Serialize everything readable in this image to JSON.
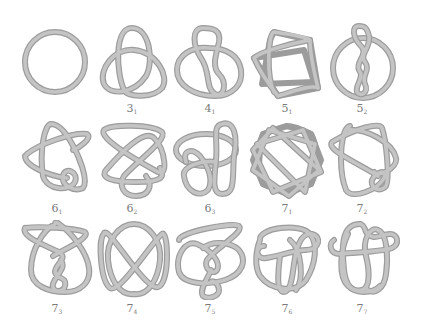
{
  "figure": {
    "stroke_colors": {
      "outline": "#9c9c9c",
      "fill": "#c4c4c4",
      "label": "#7a7a7a"
    },
    "rows": [
      {
        "knots": [
          {
            "id": "unknot",
            "crossings": "",
            "index": "",
            "label_visible": false
          },
          {
            "id": "3_1",
            "crossings": "3",
            "index": "1",
            "label_visible": true
          },
          {
            "id": "4_1",
            "crossings": "4",
            "index": "1",
            "label_visible": true
          },
          {
            "id": "5_1",
            "crossings": "5",
            "index": "1",
            "label_visible": true
          },
          {
            "id": "5_2",
            "crossings": "5",
            "index": "2",
            "label_visible": true
          }
        ]
      },
      {
        "knots": [
          {
            "id": "6_1",
            "crossings": "6",
            "index": "1",
            "label_visible": true
          },
          {
            "id": "6_2",
            "crossings": "6",
            "index": "2",
            "label_visible": true
          },
          {
            "id": "6_3",
            "crossings": "6",
            "index": "3",
            "label_visible": true
          },
          {
            "id": "7_1",
            "crossings": "7",
            "index": "1",
            "label_visible": true
          },
          {
            "id": "7_2",
            "crossings": "7",
            "index": "2",
            "label_visible": true
          }
        ]
      },
      {
        "knots": [
          {
            "id": "7_3",
            "crossings": "7",
            "index": "3",
            "label_visible": true
          },
          {
            "id": "7_4",
            "crossings": "7",
            "index": "4",
            "label_visible": true
          },
          {
            "id": "7_5",
            "crossings": "7",
            "index": "5",
            "label_visible": true
          },
          {
            "id": "7_6",
            "crossings": "7",
            "index": "6",
            "label_visible": true
          },
          {
            "id": "7_7",
            "crossings": "7",
            "index": "7",
            "label_visible": true
          }
        ]
      }
    ]
  }
}
